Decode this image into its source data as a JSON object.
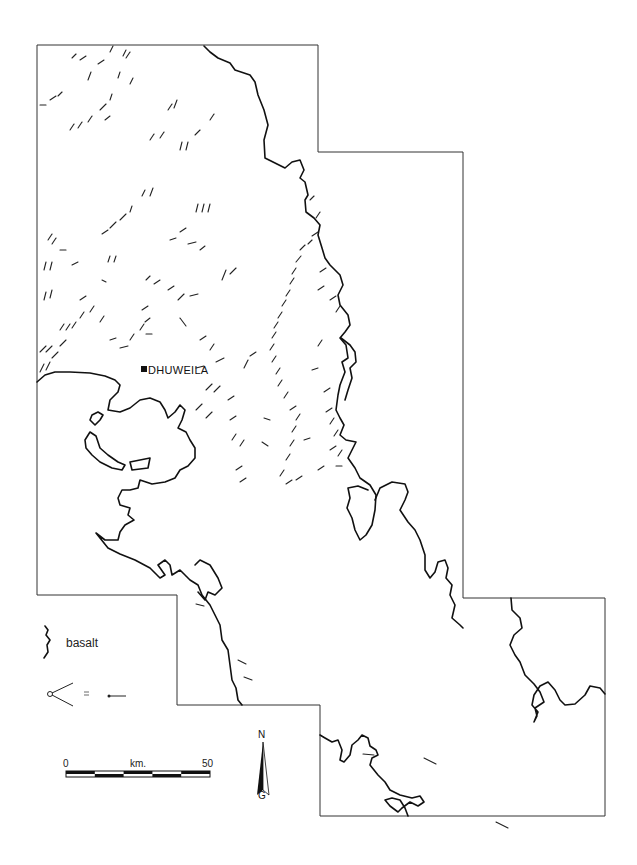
{
  "map": {
    "site": {
      "name": "DHUWEILA",
      "x": 143,
      "y": 369
    },
    "boundary_points": [
      [
        37,
        45
      ],
      [
        318,
        45
      ],
      [
        318,
        152
      ],
      [
        463,
        152
      ],
      [
        463,
        598
      ],
      [
        605,
        598
      ],
      [
        605,
        816
      ],
      [
        320,
        816
      ],
      [
        320,
        705
      ],
      [
        177,
        705
      ],
      [
        177,
        595
      ],
      [
        37,
        595
      ],
      [
        37,
        45
      ]
    ],
    "colors": {
      "ink": "#111111",
      "background": "#ffffff",
      "boundary": "#333333"
    }
  },
  "legend": {
    "basalt_label": "basalt",
    "kite_symbol": "=",
    "items": [
      {
        "symbol": "wavy-line",
        "label": "basalt"
      },
      {
        "symbol": "kite-chevron",
        "equals": "kite-dot-line"
      }
    ]
  },
  "scale_bar": {
    "start_label": "0",
    "unit_label": "km.",
    "end_label": "50",
    "segments": 5
  },
  "north_arrow": {
    "top_label": "N",
    "bottom_label": "G"
  }
}
